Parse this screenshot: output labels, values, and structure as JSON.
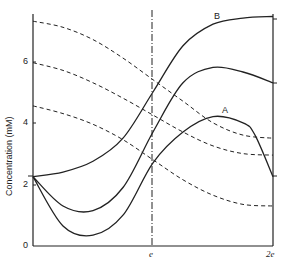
{
  "chart_data": {
    "type": "line",
    "title": "",
    "xlabel": "",
    "ylabel": "Concentration (mM)",
    "xlim": [
      0,
      2
    ],
    "ylim": [
      0,
      7.5
    ],
    "x_tick_labels": [
      "e",
      "2e"
    ],
    "y_tick_labels": [
      "0",
      "2",
      "4",
      "6"
    ],
    "y_ticks": [
      0,
      2,
      4,
      6
    ],
    "grid": false,
    "vertical_marker": {
      "x": 1,
      "label": "e",
      "style": "dash-dot"
    },
    "annotations": [
      {
        "text": "B",
        "x": 1.56,
        "y": 7.3
      },
      {
        "text": "A",
        "x": 1.57,
        "y": 4.25
      }
    ],
    "series": [
      {
        "name": "B",
        "style": "solid",
        "x": [
          0,
          0.25,
          0.5,
          0.75,
          1.0,
          1.25,
          1.5,
          1.75,
          2.0
        ],
        "values": [
          2.25,
          2.4,
          2.75,
          3.5,
          5.0,
          6.5,
          7.2,
          7.4,
          7.45
        ]
      },
      {
        "name": "middle solid",
        "style": "solid",
        "x": [
          0,
          0.25,
          0.5,
          0.75,
          1.0,
          1.25,
          1.5,
          1.75,
          2.0
        ],
        "values": [
          2.25,
          1.3,
          1.15,
          1.9,
          3.7,
          5.3,
          5.8,
          5.65,
          5.3
        ]
      },
      {
        "name": "A",
        "style": "solid",
        "x": [
          0,
          0.25,
          0.5,
          0.75,
          1.0,
          1.25,
          1.5,
          1.75,
          1.85,
          2.0
        ],
        "values": [
          2.25,
          0.65,
          0.35,
          1.0,
          2.7,
          3.7,
          4.2,
          4.0,
          3.6,
          2.25
        ]
      },
      {
        "name": "dashed 1",
        "style": "dashed",
        "x": [
          0,
          0.25,
          0.5,
          0.75,
          1.0,
          1.25,
          1.5,
          1.75,
          2.0
        ],
        "values": [
          7.3,
          7.1,
          6.7,
          6.1,
          5.4,
          4.7,
          4.0,
          3.6,
          3.5
        ]
      },
      {
        "name": "dashed 2",
        "style": "dashed",
        "x": [
          0,
          0.25,
          0.5,
          0.75,
          1.0,
          1.25,
          1.5,
          1.75,
          2.0
        ],
        "values": [
          5.95,
          5.7,
          5.3,
          4.8,
          4.25,
          3.7,
          3.25,
          3.0,
          2.95
        ]
      },
      {
        "name": "dashed 3",
        "style": "dashed",
        "x": [
          0,
          0.25,
          0.5,
          0.75,
          1.0,
          1.25,
          1.5,
          1.75,
          2.0
        ],
        "values": [
          4.55,
          4.3,
          3.95,
          3.45,
          2.8,
          2.15,
          1.65,
          1.35,
          1.3
        ]
      }
    ]
  },
  "labels": {
    "ylabel": "Concentration (mM)",
    "y0": "0",
    "y2": "2",
    "y4": "4",
    "y6": "6",
    "xe": "e",
    "x2e": "2e",
    "curveA": "A",
    "curveB": "B"
  }
}
